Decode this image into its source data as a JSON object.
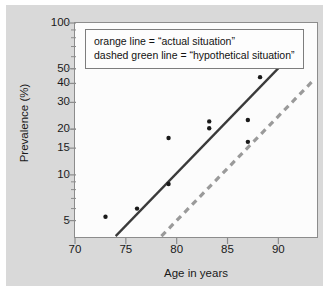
{
  "chart_data": {
    "type": "scatter",
    "title": "",
    "xlabel": "Age in years",
    "ylabel": "Prevalence (%)",
    "xlim": [
      70,
      93.8
    ],
    "ylim": [
      3.9,
      100
    ],
    "yscale": "log",
    "xscale": "linear",
    "grid": false,
    "legend_position": "top-center-inside",
    "xticks": [
      70,
      75,
      80,
      85,
      90
    ],
    "xtick_labels": [
      "70",
      "75",
      "80",
      "85",
      "90"
    ],
    "yticks": [
      5,
      10,
      15,
      20,
      30,
      40,
      50,
      100
    ],
    "ytick_labels": [
      "5",
      "10",
      "15",
      "20",
      "30",
      "40",
      "50",
      "100"
    ],
    "points": [
      {
        "x": 73.0,
        "y": 5.3
      },
      {
        "x": 76.1,
        "y": 6.0
      },
      {
        "x": 79.2,
        "y": 8.7
      },
      {
        "x": 79.2,
        "y": 17.5
      },
      {
        "x": 83.2,
        "y": 22.5
      },
      {
        "x": 83.2,
        "y": 20.3
      },
      {
        "x": 87.0,
        "y": 23.0
      },
      {
        "x": 87.0,
        "y": 16.5
      },
      {
        "x": 88.2,
        "y": 44.0
      }
    ],
    "series": [
      {
        "name": "actual situation",
        "style": "solid",
        "color": "#3a3a3a",
        "x": [
          74.0,
          90.2
        ],
        "y": [
          3.95,
          52.0
        ]
      },
      {
        "name": "hypothetical situation",
        "style": "dashed",
        "color": "#9a9a9a",
        "x": [
          78.5,
          93.6
        ],
        "y": [
          3.95,
          43.0
        ]
      }
    ],
    "annotations": [
      "orange line = “actual situation”",
      "dashed green line = “hypothetical situation”"
    ]
  },
  "legend": {
    "line1": "orange line = “actual situation”",
    "line2": "dashed green line = “hypothetical situation”"
  },
  "axes": {
    "x_title": "Age in years",
    "y_title": "Prevalence (%)"
  },
  "colors": {
    "figure_background": "#d9d9d9",
    "plot_background": "#fcfcfc",
    "axis": "#8c8c8c",
    "actual_line": "#3a3a3a",
    "hypothetical_line": "#9a9a9a",
    "point": "#1a1a1a",
    "text": "#1a1a1a"
  }
}
